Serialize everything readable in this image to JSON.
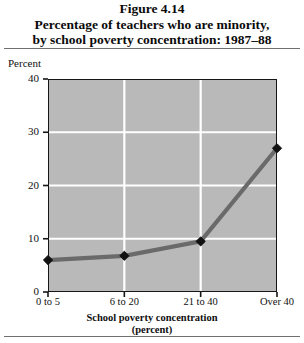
{
  "figure": {
    "number_line": "Figure 4.14",
    "title_line_1": "Percentage of teachers who are minority,",
    "title_line_2": "by school poverty concentration: 1987–88"
  },
  "axes": {
    "y_axis_label": "Percent",
    "y_ticks": [
      "0",
      "10",
      "20",
      "30",
      "40"
    ],
    "x_axis_title_line_1": "School poverty concentration",
    "x_axis_title_line_2": "(percent)",
    "x_ticks": [
      "0 to 5",
      "6 to 20",
      "21 to 40",
      "Over 40"
    ]
  },
  "colors": {
    "plot_background": "#b9b9b9",
    "gridline": "#ffffff",
    "series_line": "#6a6a6a",
    "marker": "#111111",
    "axis_frame": "#161616",
    "rule": "#6d6f72",
    "text": "#101010"
  },
  "chart_data": {
    "type": "line",
    "title": "Percentage of teachers who are minority, by school poverty concentration: 1987–88",
    "xlabel": "School poverty concentration (percent)",
    "ylabel": "Percent",
    "categories": [
      "0 to 5",
      "6 to 20",
      "21 to 40",
      "Over 40"
    ],
    "values": [
      6.0,
      6.8,
      9.5,
      27.0
    ],
    "ylim": [
      0,
      40
    ],
    "ytick_values": [
      0,
      10,
      20,
      30,
      40
    ],
    "grid": true,
    "grid_axis": "both",
    "legend": false,
    "marker": "diamond",
    "series": [
      {
        "name": "Percent of teachers who are minority",
        "values": [
          6.0,
          6.8,
          9.5,
          27.0
        ]
      }
    ]
  }
}
